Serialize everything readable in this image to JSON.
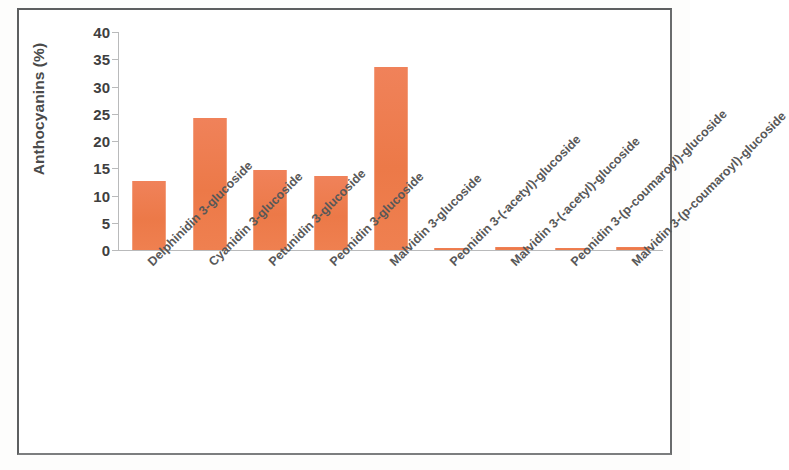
{
  "figure": {
    "background_color": "#ffffff",
    "frame_color": "#5d5f60",
    "bar_color": "#ee7d4f",
    "axis_color": "#b9babb"
  },
  "chart_data": {
    "type": "bar",
    "title": "",
    "xlabel": "",
    "ylabel": "Anthocyanins (%)",
    "ylim": [
      0,
      40
    ],
    "ytick_step": 5,
    "yticks": [
      "0",
      "5",
      "10",
      "15",
      "20",
      "25",
      "30",
      "35",
      "40"
    ],
    "grid": false,
    "legend": false,
    "categories": [
      "Delphinidin 3-glucoside",
      "Cyanidin 3-glucoside",
      "Petunidin 3-glucoside",
      "Peonidin 3-glucoside",
      "Malvidin 3-glucoside",
      "Peonidin 3-(-acetyl)-glucoside",
      "Malvidin 3-(-acetyl)-glucoside",
      "Peonidin 3-(p-coumaroyl)-glucoside",
      "Malvidin 3-(p-coumaroyl)-glucoside"
    ],
    "values": [
      12.7,
      24.3,
      14.6,
      13.6,
      33.5,
      0.4,
      0.6,
      0.05,
      0.5
    ]
  }
}
